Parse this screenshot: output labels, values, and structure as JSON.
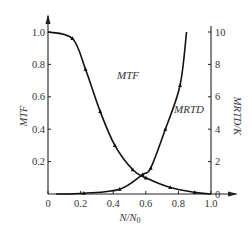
{
  "chart_data": {
    "type": "line",
    "title": "",
    "xlabel": "N/N0",
    "xlabel_main": "N/N",
    "xlabel_sub": "0",
    "ylabel_left": "MTF",
    "ylabel_right": "MRTD/K",
    "xlim": [
      0,
      1.0
    ],
    "ylim_left": [
      0,
      1.0
    ],
    "ylim_right": [
      0,
      10
    ],
    "grid": false,
    "x_ticks": [
      "0",
      "0.2",
      "0.4",
      "0.6",
      "0.8",
      "1.0"
    ],
    "y_left_ticks": [
      "0.2",
      "0.4",
      "0.6",
      "0.8",
      "1.0"
    ],
    "y_right_ticks": [
      "0",
      "2",
      "4",
      "6",
      "8",
      "10"
    ],
    "series": [
      {
        "name": "MTF",
        "axis": "left",
        "x": [
          0.0,
          0.15,
          0.23,
          0.32,
          0.41,
          0.52,
          0.6,
          0.75,
          0.9,
          1.0
        ],
        "values": [
          1.0,
          0.96,
          0.77,
          0.51,
          0.3,
          0.15,
          0.1,
          0.04,
          0.01,
          0.0
        ]
      },
      {
        "name": "MRTD",
        "axis": "right",
        "x": [
          0.05,
          0.22,
          0.44,
          0.58,
          0.63,
          0.72,
          0.81,
          0.85
        ],
        "values": [
          0.0,
          0.05,
          0.3,
          1.2,
          1.6,
          4.0,
          6.7,
          10.0
        ]
      }
    ],
    "annotations": [
      {
        "text": "MTF",
        "x": 0.3,
        "y_left": 0.76
      },
      {
        "text": "MRTD",
        "x": 0.66,
        "y_left": 0.44
      }
    ]
  }
}
